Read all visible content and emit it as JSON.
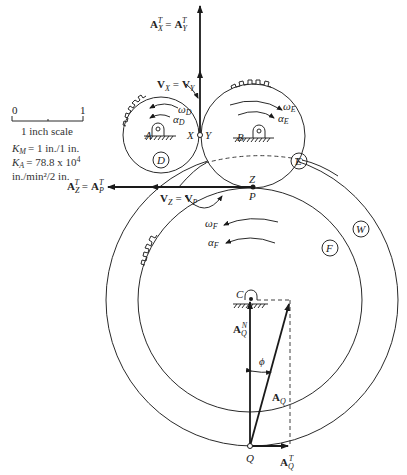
{
  "scale": {
    "tick_start": "0",
    "tick_end": "1",
    "caption": "1 inch scale"
  },
  "constants": {
    "km": {
      "sym": "K",
      "sub": "M",
      "value": "= 1 in./1 in."
    },
    "ka": {
      "sym": "K",
      "sub": "A",
      "value": "= 78.8 x 10",
      "exp": "4"
    },
    "ka_units": "in./min²/2 in."
  },
  "vectors": {
    "ax_ay": {
      "a1": "A",
      "s1": "X",
      "t": "T",
      "eq": "=",
      "a2": "A",
      "s2": "Y"
    },
    "vx_vy": {
      "v1": "V",
      "s1": "X",
      "eq": "=",
      "v2": "V",
      "s2": "Y"
    },
    "az_ap": {
      "a1": "A",
      "s1": "Z",
      "t": "T",
      "eq": "=",
      "a2": "A",
      "s2": "P"
    },
    "vz_vp": {
      "v1": "V",
      "s1": "Z",
      "eq": "=",
      "v2": "V",
      "s2": "P"
    },
    "aqn": {
      "a": "A",
      "s": "Q",
      "sup": "N"
    },
    "aq": {
      "a": "A",
      "s": "Q"
    },
    "aqt": {
      "a": "A",
      "s": "Q",
      "sup": "T"
    },
    "phi": "ϕ"
  },
  "points": {
    "A": "A",
    "B": "B",
    "C": "C",
    "X": "X",
    "Y": "Y",
    "Z": "Z",
    "P": "P",
    "Q": "Q"
  },
  "gears": {
    "D": {
      "label": "D",
      "omega": "ω",
      "alpha": "α",
      "sub": "D"
    },
    "E": {
      "label": "E",
      "omega": "ω",
      "alpha": "α",
      "sub": "E"
    },
    "F": {
      "label": "F",
      "omega": "ω",
      "alpha": "α",
      "sub": "F"
    },
    "W": {
      "label": "W"
    }
  }
}
